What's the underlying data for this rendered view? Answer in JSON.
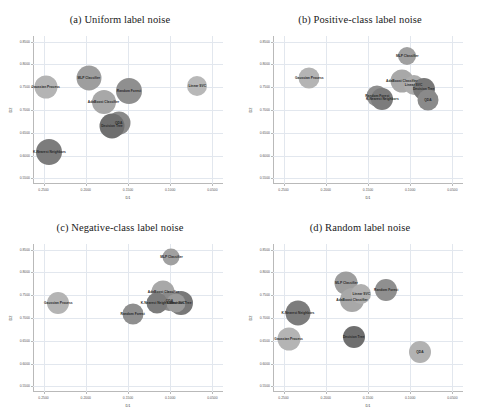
{
  "figure": {
    "caption_faint": "",
    "axis_label_x": "D1",
    "axis_label_y": "D2",
    "x_ticks": [
      "0.2500",
      "0.2000",
      "0.1500",
      "0.1000",
      "0.0500"
    ],
    "y_ticks": [
      "0.8500",
      "0.8000",
      "0.7500",
      "0.7000",
      "0.6500",
      "0.6000",
      "0.5500"
    ],
    "x_range": [
      0.2625,
      0.0375
    ],
    "y_range": [
      0.5375,
      0.8625
    ]
  },
  "chart_data": [
    {
      "type": "scatter",
      "title": "(a) Uniform label noise",
      "xlabel": "D1",
      "ylabel": "D2",
      "xlim": [
        0.2625,
        0.0375
      ],
      "ylim": [
        0.5375,
        0.8625
      ],
      "xticks": [
        "0.2500",
        "0.2000",
        "0.1500",
        "0.1000",
        "0.0500"
      ],
      "yticks": [
        "0.8500",
        "0.8000",
        "0.7500",
        "0.7000",
        "0.6500",
        "0.6000",
        "0.5500"
      ],
      "grid": true,
      "legend": "none",
      "points": [
        {
          "label": "Gaussian Process",
          "x": 0.2475,
          "y": 0.751,
          "size": 23,
          "color": "#b4b4b4"
        },
        {
          "label": "MLP Classifier",
          "x": 0.1965,
          "y": 0.77,
          "size": 25,
          "color": "#9e9e9e"
        },
        {
          "label": "Random Forest",
          "x": 0.149,
          "y": 0.742,
          "size": 26,
          "color": "#8f8f8f"
        },
        {
          "label": "AdaBoost Classifier",
          "x": 0.179,
          "y": 0.718,
          "size": 24,
          "color": "#a8a8a8"
        },
        {
          "label": "QDA",
          "x": 0.161,
          "y": 0.672,
          "size": 23,
          "color": "#8a8a8a"
        },
        {
          "label": "Decision Tree",
          "x": 0.169,
          "y": 0.664,
          "size": 25,
          "color": "#6f6f6f"
        },
        {
          "label": "K-Nearest Neighbors",
          "x": 0.243,
          "y": 0.6085,
          "size": 26,
          "color": "#7c7c7c"
        },
        {
          "label": "Linear SVC",
          "x": 0.068,
          "y": 0.752,
          "size": 20,
          "color": "#b8b8b8"
        }
      ]
    },
    {
      "type": "scatter",
      "title": "(b) Positive-class label noise",
      "xlabel": "D1",
      "ylabel": "D2",
      "xlim": [
        0.2625,
        0.0375
      ],
      "ylim": [
        0.5375,
        0.8625
      ],
      "xticks": [
        "0.2500",
        "0.2000",
        "0.1500",
        "0.1000",
        "0.0500"
      ],
      "yticks": [
        "0.8500",
        "0.8000",
        "0.7500",
        "0.7000",
        "0.6500",
        "0.6000",
        "0.5500"
      ],
      "grid": true,
      "legend": "none",
      "points": [
        {
          "label": "Gaussian Process",
          "x": 0.2195,
          "y": 0.771,
          "size": 21,
          "color": "#b4b4b4"
        },
        {
          "label": "MLP Classifier",
          "x": 0.1035,
          "y": 0.818,
          "size": 18,
          "color": "#a0a0a0"
        },
        {
          "label": "AdaBoost Classifier",
          "x": 0.11,
          "y": 0.764,
          "size": 23,
          "color": "#a8a8a8"
        },
        {
          "label": "Linear SVC",
          "x": 0.096,
          "y": 0.754,
          "size": 20,
          "color": "#adadad"
        },
        {
          "label": "Decision Tree",
          "x": 0.084,
          "y": 0.747,
          "size": 22,
          "color": "#787878"
        },
        {
          "label": "Random Forest",
          "x": 0.139,
          "y": 0.731,
          "size": 21,
          "color": "#8f8f8f"
        },
        {
          "label": "K-Nearest Neighbors",
          "x": 0.133,
          "y": 0.724,
          "size": 22,
          "color": "#7c7c7c"
        },
        {
          "label": "QDA",
          "x": 0.079,
          "y": 0.723,
          "size": 21,
          "color": "#8a8a8a"
        }
      ]
    },
    {
      "type": "scatter",
      "title": "(c) Negative-class label noise",
      "xlabel": "D1",
      "ylabel": "D2",
      "xlim": [
        0.2625,
        0.0375
      ],
      "ylim": [
        0.5375,
        0.8625
      ],
      "xticks": [
        "0.2500",
        "0.2000",
        "0.1500",
        "0.1000",
        "0.0500"
      ],
      "yticks": [
        "0.8500",
        "0.8000",
        "0.7500",
        "0.7000",
        "0.6500",
        "0.6000",
        "0.5500"
      ],
      "grid": true,
      "legend": "none",
      "points": [
        {
          "label": "MLP Classifier",
          "x": 0.0985,
          "y": 0.833,
          "size": 17,
          "color": "#a0a0a0"
        },
        {
          "label": "Gaussian Process",
          "x": 0.2325,
          "y": 0.733,
          "size": 22,
          "color": "#b4b4b4"
        },
        {
          "label": "AdaBoost Classifier",
          "x": 0.108,
          "y": 0.756,
          "size": 23,
          "color": "#a8a8a8"
        },
        {
          "label": "QDA",
          "x": 0.101,
          "y": 0.738,
          "size": 20,
          "color": "#8a8a8a"
        },
        {
          "label": "K-Nearest Neighbors",
          "x": 0.1155,
          "y": 0.732,
          "size": 21,
          "color": "#7c7c7c"
        },
        {
          "label": "Decision Tree",
          "x": 0.0875,
          "y": 0.732,
          "size": 24,
          "color": "#787878"
        },
        {
          "label": "Linear SVC",
          "x": 0.093,
          "y": 0.733,
          "size": 19,
          "color": "#9a9a9a"
        },
        {
          "label": "Random Forest",
          "x": 0.1445,
          "y": 0.708,
          "size": 21,
          "color": "#8f8f8f"
        }
      ]
    },
    {
      "type": "scatter",
      "title": "(d) Random label noise",
      "xlabel": "D1",
      "ylabel": "D2",
      "xlim": [
        0.2625,
        0.0375
      ],
      "ylim": [
        0.5375,
        0.8625
      ],
      "xticks": [
        "0.2500",
        "0.2000",
        "0.1500",
        "0.1000",
        "0.0500"
      ],
      "yticks": [
        "0.8500",
        "0.8000",
        "0.7500",
        "0.7000",
        "0.6500",
        "0.6000",
        "0.5500"
      ],
      "grid": true,
      "legend": "none",
      "points": [
        {
          "label": "MLP Classifier",
          "x": 0.1755,
          "y": 0.776,
          "size": 23,
          "color": "#9e9e9e"
        },
        {
          "label": "Random Forest",
          "x": 0.1285,
          "y": 0.761,
          "size": 22,
          "color": "#8f8f8f"
        },
        {
          "label": "AdaBoost Classifier",
          "x": 0.169,
          "y": 0.739,
          "size": 24,
          "color": "#a8a8a8"
        },
        {
          "label": "Linear SVC",
          "x": 0.158,
          "y": 0.753,
          "size": 20,
          "color": "#b0b0b0"
        },
        {
          "label": "K-Nearest Neighbors",
          "x": 0.233,
          "y": 0.712,
          "size": 25,
          "color": "#7c7c7c"
        },
        {
          "label": "Gaussian Process",
          "x": 0.244,
          "y": 0.654,
          "size": 23,
          "color": "#b4b4b4"
        },
        {
          "label": "Decision Tree",
          "x": 0.167,
          "y": 0.659,
          "size": 22,
          "color": "#6f6f6f"
        },
        {
          "label": "QDA",
          "x": 0.0885,
          "y": 0.626,
          "size": 22,
          "color": "#b2b2b2"
        }
      ]
    }
  ]
}
